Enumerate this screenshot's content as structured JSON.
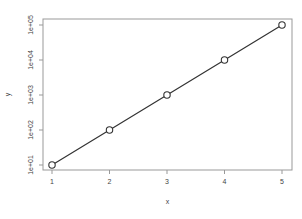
{
  "chart_data": {
    "type": "line",
    "title": "",
    "xlabel": "x",
    "ylabel": "y",
    "x": [
      1,
      2,
      3,
      4,
      5
    ],
    "values": [
      10,
      100,
      1000,
      10000,
      100000
    ],
    "yscale": "log",
    "x_ticks": [
      "1",
      "2",
      "3",
      "4",
      "5"
    ],
    "y_ticks": [
      "1e+01",
      "1e+02",
      "1e+03",
      "1e+04",
      "1e+05"
    ],
    "xlim": [
      1,
      5
    ],
    "ylim": [
      10,
      100000
    ],
    "grid": false,
    "marker": "open-circle",
    "line_color": "#333333"
  }
}
